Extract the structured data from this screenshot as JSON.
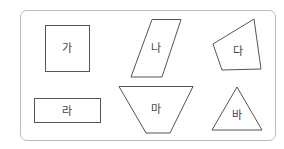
{
  "diagram": {
    "border_color": "#bdbdbd",
    "stroke_color": "#555555",
    "shapes": [
      {
        "id": "ga",
        "label": "가",
        "kind": "square"
      },
      {
        "id": "na",
        "label": "나",
        "kind": "parallelogram"
      },
      {
        "id": "da",
        "label": "다",
        "kind": "quadrilateral"
      },
      {
        "id": "ra",
        "label": "라",
        "kind": "rectangle"
      },
      {
        "id": "ma",
        "label": "마",
        "kind": "trapezoid"
      },
      {
        "id": "ba",
        "label": "바",
        "kind": "triangle"
      }
    ]
  }
}
